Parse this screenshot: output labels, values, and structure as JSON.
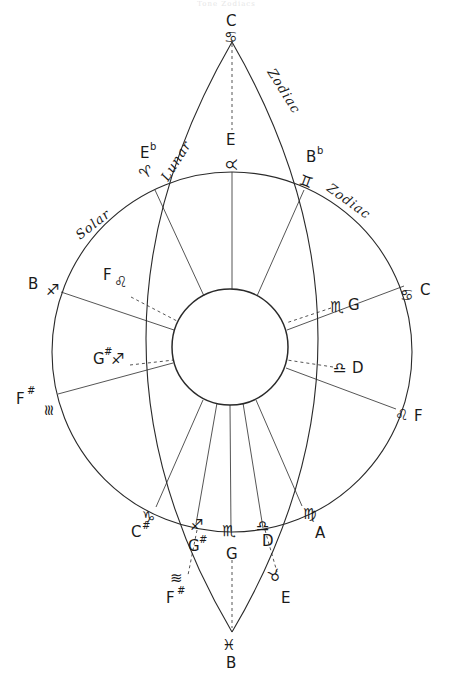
{
  "header": {
    "text": "Tone Zodiacs"
  },
  "arc_labels": {
    "lunar": "Lunar",
    "zodiac_lunar": "Zodiac",
    "solar": "Solar",
    "zodiac_solar": "Zodiac"
  },
  "vertices": {
    "top": {
      "note": "C",
      "sign": "♋",
      "sign_name": "cancer"
    },
    "bottom": {
      "note": "B",
      "sign": "♓",
      "sign_name": "pisces"
    }
  },
  "outer_points": [
    {
      "id": "aries",
      "sign": "♈",
      "note": "E",
      "accidental": "b"
    },
    {
      "id": "gemini",
      "sign": "♊",
      "note": "B",
      "accidental": "b"
    },
    {
      "id": "sagittarius-left",
      "sign": "♐",
      "note": "B",
      "accidental": ""
    },
    {
      "id": "aquarius-left",
      "sign": "≋",
      "note": "F",
      "accidental": "#"
    },
    {
      "id": "cancer-right",
      "sign": "♋",
      "note": "C",
      "accidental": ""
    },
    {
      "id": "leo-right",
      "sign": "♌",
      "note": "F",
      "accidental": ""
    },
    {
      "id": "capricorn",
      "sign": "♑",
      "note": "C",
      "accidental": "#"
    },
    {
      "id": "virgo",
      "sign": "♍",
      "note": "A",
      "accidental": ""
    }
  ],
  "inner_points": [
    {
      "id": "taurus-top",
      "sign": "♉",
      "note": "E",
      "accidental": ""
    },
    {
      "id": "leo-inner",
      "sign": "♌",
      "note": "F",
      "accidental": ""
    },
    {
      "id": "sagittarius-inner",
      "sign": "♐",
      "note": "G",
      "accidental": "#"
    },
    {
      "id": "scorpio-inner",
      "sign": "♏",
      "note": "G",
      "accidental": ""
    },
    {
      "id": "libra-inner",
      "sign": "♎",
      "note": "D",
      "accidental": ""
    },
    {
      "id": "sagittarius-bottom",
      "sign": "♐",
      "note": "G",
      "accidental": "#"
    },
    {
      "id": "scorpio-bottom",
      "sign": "♏",
      "note": "G",
      "accidental": ""
    },
    {
      "id": "libra-bottom",
      "sign": "♎",
      "note": "D",
      "accidental": ""
    },
    {
      "id": "aquarius-bottom",
      "sign": "≋",
      "note": "F",
      "accidental": "#"
    },
    {
      "id": "taurus-bottom",
      "sign": "♉",
      "note": "E",
      "accidental": ""
    }
  ],
  "colors": {
    "ink": "#1a1a1a",
    "line": "#2a2a2a",
    "background": "#ffffff"
  }
}
